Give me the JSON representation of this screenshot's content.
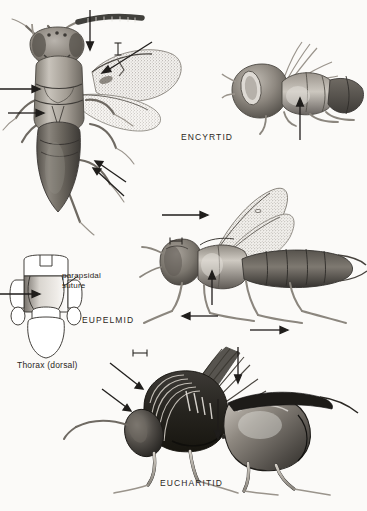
{
  "plate": {
    "title_alt": "Parasitic wasp families plate",
    "background": "#fbfaf8",
    "ink": "#2a2723",
    "width": 367,
    "height": 511
  },
  "labels": {
    "encyrtid": "ENCYRTID",
    "eupelmid": "EUPELMID",
    "eucharitid": "EUCHARITID",
    "parapsidal_suture": "parapsidal suture",
    "thorax_dorsal": "Thorax (dorsal)"
  },
  "figures": [
    {
      "id": "encyrtid-dorsal",
      "name": "Encyrtid dorsal habitus",
      "scalebar": "vertical"
    },
    {
      "id": "encyrtid-lateral",
      "name": "Encyrtid lateral head and mesosoma",
      "scalebar": "none"
    },
    {
      "id": "eupelmid-lateral",
      "name": "Eupelmid lateral habitus",
      "scalebar": "horizontal"
    },
    {
      "id": "eupelmid-thorax",
      "name": "Eupelmid thorax dorsal diagram",
      "scalebar": "none"
    },
    {
      "id": "eucharitid-lateral",
      "name": "Eucharitid lateral habitus",
      "scalebar": "horizontal"
    }
  ],
  "icons": {
    "arrow": "arrow-pointer-icon",
    "scalebar": "scale-bar-icon"
  }
}
